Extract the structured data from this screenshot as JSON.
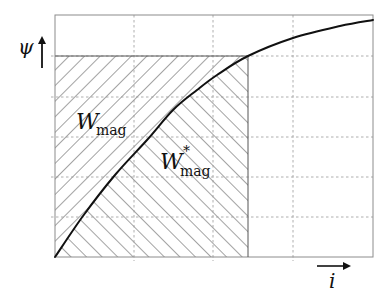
{
  "diagram": {
    "y_axis": {
      "symbol": "ψ",
      "arrow": "up-arrow"
    },
    "x_axis": {
      "symbol": "i",
      "arrow": "right-arrow"
    },
    "regions": [
      {
        "id": "energy",
        "label_main": "W",
        "label_sub": "mag",
        "label_sup": "",
        "hatch": "backslash",
        "description": "area between ψ-axis and curve"
      },
      {
        "id": "coenergy",
        "label_main": "W",
        "label_sub": "mag",
        "label_sup": "*",
        "hatch": "slash",
        "description": "area between curve and i-axis"
      }
    ],
    "frame": {
      "x0": 55,
      "y0": 15,
      "x1": 373,
      "y1": 257
    },
    "grid": {
      "vertical_x": [
        134,
        213,
        293
      ],
      "horizontal_y": [
        56,
        97,
        137,
        177,
        217
      ],
      "style": "dashed"
    },
    "operating_point": {
      "x": 248,
      "y": 56
    },
    "curve_points": [
      [
        55,
        257
      ],
      [
        83,
        216
      ],
      [
        115,
        175
      ],
      [
        147,
        140
      ],
      [
        173,
        110
      ],
      [
        197,
        90
      ],
      [
        217,
        75
      ],
      [
        248,
        56
      ],
      [
        293,
        38
      ],
      [
        340,
        26
      ],
      [
        373,
        20
      ]
    ],
    "colors": {
      "line": "#111111",
      "grid": "#9a9a9a",
      "frame": "#8c8c8c",
      "hatch": "#333333",
      "background": "#ffffff"
    }
  }
}
